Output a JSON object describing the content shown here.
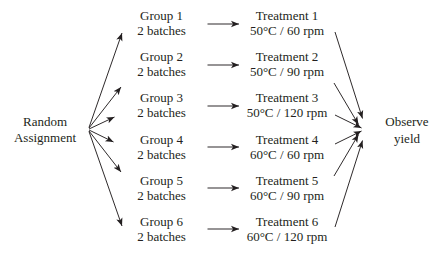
{
  "diagram": {
    "colors": {
      "background": "#ffffff",
      "text": "#231f20",
      "arrow": "#231f20"
    },
    "source": {
      "line1": "Random",
      "line2": "Assignment"
    },
    "groups": [
      {
        "name": "Group 1",
        "sub": "2 batches"
      },
      {
        "name": "Group 2",
        "sub": "2 batches"
      },
      {
        "name": "Group 3",
        "sub": "2 batches"
      },
      {
        "name": "Group 4",
        "sub": "2 batches"
      },
      {
        "name": "Group 5",
        "sub": "2 batches"
      },
      {
        "name": "Group 6",
        "sub": "2 batches"
      }
    ],
    "treatments": [
      {
        "name": "Treatment 1",
        "sub": "50°C / 60 rpm"
      },
      {
        "name": "Treatment 2",
        "sub": "50°C / 90 rpm"
      },
      {
        "name": "Treatment 3",
        "sub": "50°C / 120 rpm"
      },
      {
        "name": "Treatment 4",
        "sub": "60°C / 60 rpm"
      },
      {
        "name": "Treatment 5",
        "sub": "60°C / 90 rpm"
      },
      {
        "name": "Treatment 6",
        "sub": "60°C / 120 rpm"
      }
    ],
    "outcome": {
      "line1": "Observe",
      "line2": "yield"
    }
  }
}
